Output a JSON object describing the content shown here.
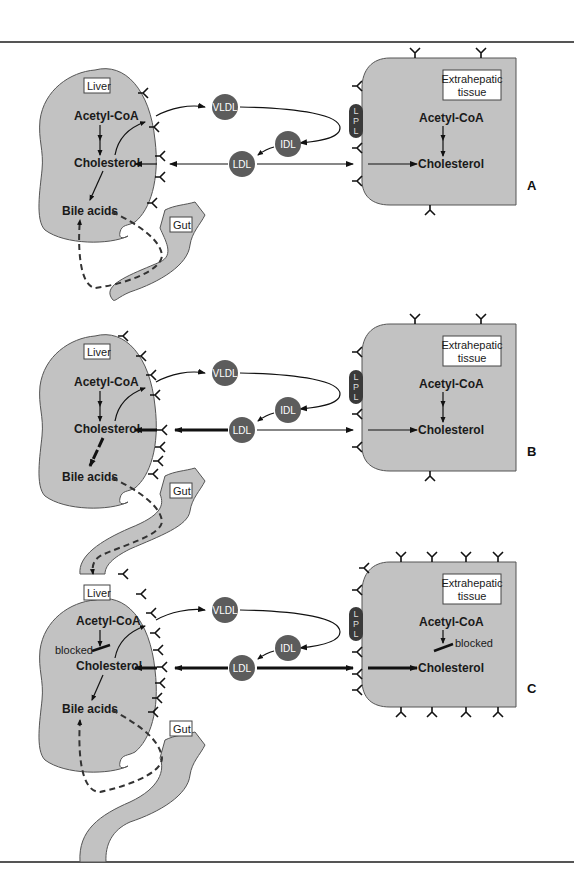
{
  "figure": {
    "panels": [
      {
        "letter": "A",
        "liver": {
          "label": "Liver",
          "acetyl": "Acetyl-CoA",
          "cholesterol": "Cholesterol",
          "bile": "Bile acids",
          "blocked": ""
        },
        "gut": "Gut",
        "lipoproteins": {
          "vldl": "VLDL",
          "idl": "IDL",
          "ldl": "LDL"
        },
        "lpl": [
          "L",
          "P",
          "L"
        ],
        "tissue": {
          "label_line1": "Extrahepatic",
          "label_line2": "tissue",
          "acetyl": "Acetyl-CoA",
          "cholesterol": "Cholesterol",
          "blocked": ""
        },
        "ldl_uptake": "normal",
        "liver_receptor_count": 5,
        "tissue_receptor_count": 6
      },
      {
        "letter": "B",
        "liver": {
          "label": "Liver",
          "acetyl": "Acetyl-CoA",
          "cholesterol": "Cholesterol",
          "bile": "Bile acids",
          "blocked": ""
        },
        "gut": "Gut",
        "lipoproteins": {
          "vldl": "VLDL",
          "idl": "IDL",
          "ldl": "LDL"
        },
        "lpl": [
          "L",
          "P",
          "L"
        ],
        "tissue": {
          "label_line1": "Extrahepatic",
          "label_line2": "tissue",
          "acetyl": "Acetyl-CoA",
          "cholesterol": "Cholesterol",
          "blocked": ""
        },
        "ldl_uptake": "increased (liver)",
        "liver_receptor_count": 9,
        "tissue_receptor_count": 6
      },
      {
        "letter": "C",
        "liver": {
          "label": "Liver",
          "acetyl": "Acetyl-CoA",
          "cholesterol": "Cholesterol",
          "bile": "Bile acids",
          "blocked": "blocked"
        },
        "gut": "Gut",
        "lipoproteins": {
          "vldl": "VLDL",
          "idl": "IDL",
          "ldl": "LDL"
        },
        "lpl": [
          "L",
          "P",
          "L"
        ],
        "tissue": {
          "label_line1": "Extrahepatic",
          "label_line2": "tissue",
          "acetyl": "Acetyl-CoA",
          "cholesterol": "Cholesterol",
          "blocked": "blocked"
        },
        "ldl_uptake": "increased (liver and tissue)",
        "liver_receptor_count": 9,
        "tissue_receptor_count": 13
      }
    ]
  },
  "colors": {
    "organ_fill": "#c2c2c2",
    "lipoprotein": "#5c5c5c",
    "lpl": "#3a3a3a"
  }
}
